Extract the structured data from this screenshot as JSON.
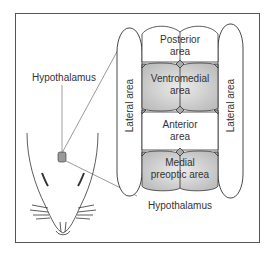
{
  "diagram": {
    "callout_label": "Hypothalamus",
    "bottom_label": "Hypothalamus",
    "regions": {
      "posterior": {
        "line1": "Posterior",
        "line2": "area",
        "fill": "#ffffff"
      },
      "ventromedial": {
        "line1": "Ventromedial",
        "line2": "area",
        "fill": "#d0d0d0"
      },
      "anterior": {
        "line1": "Anterior",
        "line2": "area",
        "fill": "#ffffff"
      },
      "medial_preoptic": {
        "line1": "Medial",
        "line2": "preoptic area",
        "fill": "#d8d8d8"
      },
      "lateral_left": {
        "label": "Lateral area"
      },
      "lateral_right": {
        "label": "Lateral area"
      }
    },
    "colors": {
      "stroke": "#333333",
      "frame": "#555555",
      "shade": "#cfcfcf"
    }
  }
}
